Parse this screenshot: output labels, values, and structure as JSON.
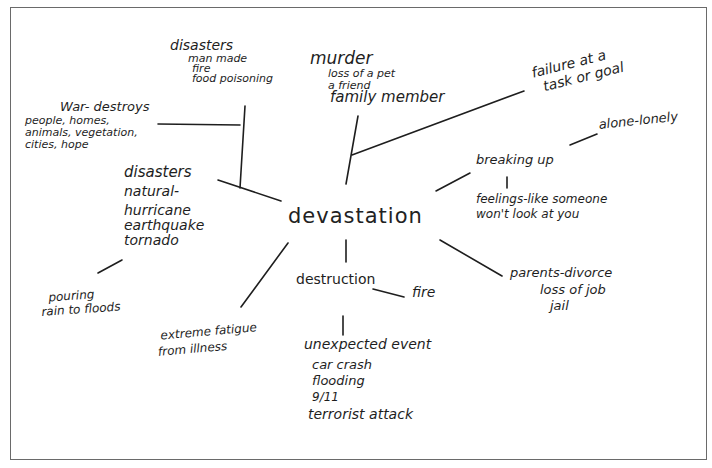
{
  "diagram": {
    "type": "handwritten-word-web",
    "center": "devastation",
    "nodes": {
      "disasters_man_made": {
        "lines": [
          "disasters",
          "man made",
          "fire",
          "food poisoning"
        ]
      },
      "murder": {
        "lines": [
          "murder",
          "loss of a pet",
          "a friend",
          "family member"
        ]
      },
      "failure": {
        "lines": [
          "failure at a",
          "task or goal"
        ]
      },
      "war": {
        "lines": [
          "War- destroys",
          "people, homes,",
          "animals, vegetation,",
          "cities, hope"
        ]
      },
      "disasters_natural": {
        "lines": [
          "disasters",
          "natural-",
          "hurricane",
          "earthquake",
          "tornado"
        ]
      },
      "pouring": {
        "lines": [
          "pouring",
          "rain to floods"
        ]
      },
      "breaking_up": {
        "lines": [
          "breaking up"
        ]
      },
      "alone": {
        "lines": [
          "alone-lonely"
        ]
      },
      "feelings": {
        "lines": [
          "feelings-like someone",
          "won't look at you"
        ]
      },
      "parents": {
        "lines": [
          "parents-divorce",
          "loss of job",
          "jail"
        ]
      },
      "destruction": {
        "lines": [
          "destruction"
        ]
      },
      "fire": {
        "lines": [
          "fire"
        ]
      },
      "fatigue": {
        "lines": [
          "extreme fatigue",
          "from illness"
        ]
      },
      "unexpected": {
        "lines": [
          "unexpected event",
          "car crash",
          "flooding",
          "9/11",
          "terrorist attack"
        ]
      }
    },
    "colors": {
      "ink": "#1e1e1e",
      "frame": "#6a6a6a",
      "paper": "#ffffff"
    }
  }
}
